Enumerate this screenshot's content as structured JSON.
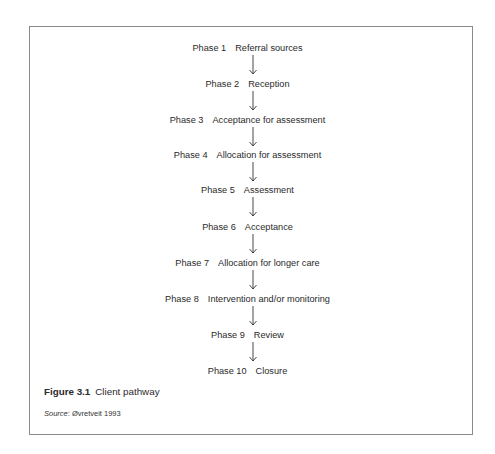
{
  "figure": {
    "phases": [
      {
        "number": "Phase 1",
        "label": "Referral sources"
      },
      {
        "number": "Phase 2",
        "label": "Reception"
      },
      {
        "number": "Phase 3",
        "label": "Acceptance for assessment"
      },
      {
        "number": "Phase 4",
        "label": "Allocation for assessment"
      },
      {
        "number": "Phase 5",
        "label": "Assessment"
      },
      {
        "number": "Phase 6",
        "label": "Acceptance"
      },
      {
        "number": "Phase 7",
        "label": "Allocation for longer care"
      },
      {
        "number": "Phase 8",
        "label": "Intervention and/or monitoring"
      },
      {
        "number": "Phase 9",
        "label": "Review"
      },
      {
        "number": "Phase 10",
        "label": "Closure"
      }
    ],
    "caption_label": "Figure 3.1",
    "caption_text": "Client pathway",
    "source_label": "Source",
    "source_text": ": Øvretveit 1993"
  }
}
